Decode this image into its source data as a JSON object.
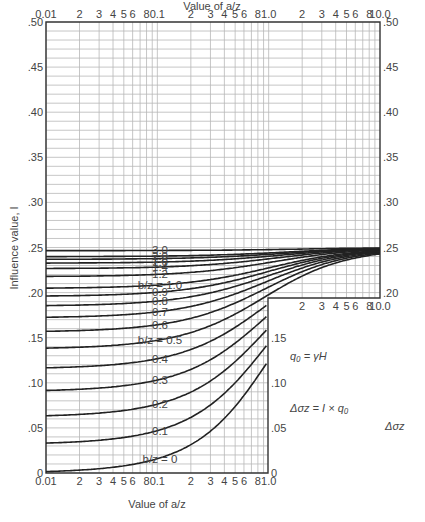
{
  "chart_data": {
    "type": "line",
    "title": "",
    "xlabel_top": "Value of a/z",
    "xlabel_bottom": "Value of a/z",
    "ylabel": "Influence value, I",
    "xscale": "log",
    "xlim_top": [
      0.01,
      10.0
    ],
    "xlim_bottom": [
      0.01,
      1.0
    ],
    "ylim": [
      0,
      0.5
    ],
    "grid": true,
    "x_ticks_top": [
      "0.01",
      "2",
      "3",
      "4",
      "5",
      "6",
      "8",
      "0.1",
      "2",
      "3",
      "4",
      "5",
      "6",
      "8",
      "1.0",
      "2",
      "3",
      "4",
      "5",
      "6",
      "8",
      "10.0"
    ],
    "x_ticks_bottom": [
      "0.01",
      "2",
      "3",
      "4",
      "5",
      "6",
      "8",
      "0.1",
      "2",
      "3",
      "4",
      "5",
      "6",
      "8",
      "1.0"
    ],
    "x_ticks_inset": [
      "2",
      "3",
      "4",
      "5",
      "6",
      "8",
      "10.0"
    ],
    "y_ticks_left": [
      "0",
      ".05",
      ".10",
      ".15",
      ".20",
      ".25",
      ".30",
      ".35",
      ".40",
      ".45",
      ".50"
    ],
    "y_ticks_right": [
      "0",
      ".05",
      ".10",
      ".15",
      ".20",
      ".25",
      ".30",
      ".35",
      ".40",
      ".45",
      ".50"
    ],
    "series_note": "Curve labels and axis ticks are read from the image. Per-curve values are NOT digitized from pixels; they are computed from a standard embankment-loading influence formula and approximate the figure's shape. Treat them as illustrative, not measured.",
    "series_values_are_approximate": true,
    "series": [
      {
        "name": "b/z = 0",
        "label": "b/z = 0",
        "b_over_z": 0
      },
      {
        "name": "b/z = 0.1",
        "label": "0.1",
        "b_over_z": 0.1
      },
      {
        "name": "b/z = 0.2",
        "label": "0.2",
        "b_over_z": 0.2
      },
      {
        "name": "b/z = 0.3",
        "label": "0.3",
        "b_over_z": 0.3
      },
      {
        "name": "b/z = 0.4",
        "label": "0.4",
        "b_over_z": 0.4
      },
      {
        "name": "b/z = 0.5",
        "label": "b/z = 0.5",
        "b_over_z": 0.5
      },
      {
        "name": "b/z = 0.6",
        "label": "0.6",
        "b_over_z": 0.6
      },
      {
        "name": "b/z = 0.7",
        "label": "0.7",
        "b_over_z": 0.7
      },
      {
        "name": "b/z = 0.8",
        "label": "0.8",
        "b_over_z": 0.8
      },
      {
        "name": "b/z = 0.9",
        "label": "0.9",
        "b_over_z": 0.9
      },
      {
        "name": "b/z = 1.0",
        "label": "b/z = 1.0",
        "b_over_z": 1.0
      },
      {
        "name": "b/z = 1.2",
        "label": "1.2",
        "b_over_z": 1.2
      },
      {
        "name": "b/z = 1.4",
        "label": "1.4",
        "b_over_z": 1.4
      },
      {
        "name": "b/z = 1.6",
        "label": "1.6",
        "b_over_z": 1.6
      },
      {
        "name": "b/z = 1.8",
        "label": "1.8",
        "b_over_z": 1.8
      },
      {
        "name": "b/z = 2.0",
        "label": "2.0",
        "b_over_z": 2.0
      },
      {
        "name": "b/z = 3.0",
        "label": "3.0",
        "b_over_z": 3.0
      }
    ],
    "inset": {
      "labels": {
        "a": "a",
        "b": "b",
        "H": "H",
        "z": "z"
      },
      "eq1": "q₀ = γH",
      "eq2": "Δσz = I × q₀",
      "stress_label": "Δσz"
    }
  },
  "colors": {
    "curve": "#222222",
    "grid": "#b8b8b8",
    "axis": "#333333",
    "text": "#444444"
  }
}
